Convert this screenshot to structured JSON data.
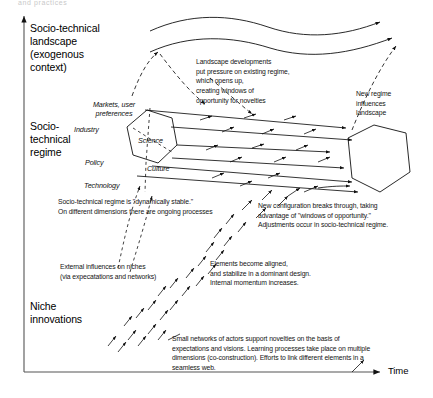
{
  "figure": {
    "type": "multi-level-perspective-diagram",
    "top_cropped_caption": "and practices",
    "axes": {
      "y_axis_name": "levels",
      "x_axis_label": "Time"
    },
    "levels": [
      {
        "id": "landscape",
        "label": "Socio-technical\nlandscape\n(exogenous\ncontext)"
      },
      {
        "id": "regime",
        "label": "Socio-\ntechnical\nregime"
      },
      {
        "id": "niche",
        "label": "Niche\ninnovations"
      }
    ],
    "regime_dimensions": [
      {
        "id": "markets",
        "label": "Markets, user\npreferences"
      },
      {
        "id": "industry",
        "label": "Industry"
      },
      {
        "id": "science",
        "label": "Science"
      },
      {
        "id": "policy",
        "label": "Policy"
      },
      {
        "id": "culture",
        "label": "Culture"
      },
      {
        "id": "technology",
        "label": "Technology"
      }
    ],
    "annotations": [
      {
        "id": "landscape-pressure",
        "text": "Landscape developments\nput pressure on existing regime,\nwhich opens up,\ncreating windows of\nopportunity for novelties"
      },
      {
        "id": "new-regime-influences",
        "text": "New regime\ninfluences\nlandscape"
      },
      {
        "id": "regime-dynamically-stable",
        "text": "Socio-technical regime is \"dynamically stable.\"\nOn different dimensions there are ongoing processes"
      },
      {
        "id": "new-configuration",
        "text": "New configuration breaks through, taking\nadvantage of \"windows of opportunity.\"\nAdjustments occur in socio-technical regime."
      },
      {
        "id": "external-influences",
        "text": "External influences on niches\n(via expecatations and networks)"
      },
      {
        "id": "elements-aligned",
        "text": "Elements become aligned,\nand stabilize in a dominant design.\nInternal momentum increases."
      },
      {
        "id": "small-networks",
        "text": "Small networks of actors support novelties on the basis of\nexpectations and visions. Learning processes take place on multiple\ndimensions (co-construction). Efforts to link different elements in a\nseamless web."
      }
    ],
    "colors": {
      "ink": "#111111",
      "background": "#ffffff"
    }
  }
}
